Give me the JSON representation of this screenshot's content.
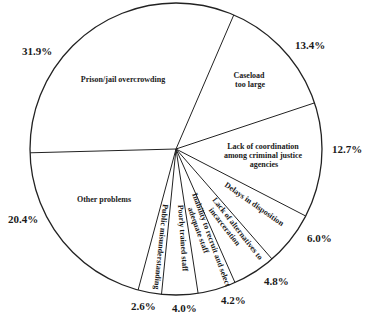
{
  "chart_data": {
    "type": "pie",
    "title": "",
    "start_angle_deg": 178.5,
    "direction": "clockwise",
    "slices": [
      {
        "label": "Prison/jail overcrowding",
        "value": 31.9,
        "pct_label": "31.9%"
      },
      {
        "label": "Caseload too large",
        "value": 13.4,
        "pct_label": "13.4%"
      },
      {
        "label": "Lack of coordination among criminal justice agencies",
        "value": 12.7,
        "pct_label": "12.7%"
      },
      {
        "label": "Delays in disposition",
        "value": 6.0,
        "pct_label": "6.0%"
      },
      {
        "label": "Lack of alternatives to incarceration",
        "value": 4.8,
        "pct_label": "4.8%"
      },
      {
        "label": "Inability to recruit and select adequate staff",
        "value": 4.2,
        "pct_label": "4.2%"
      },
      {
        "label": "Poorly trained staff",
        "value": 4.0,
        "pct_label": "4.0%"
      },
      {
        "label": "Public misunderstanding",
        "value": 2.6,
        "pct_label": "2.6%"
      },
      {
        "label": "Other problems",
        "value": 20.4,
        "pct_label": "20.4%"
      }
    ],
    "legend": "none (labels inside slices, percentages outside)"
  },
  "labels": {
    "prison": [
      "Prison/jail overcrowding"
    ],
    "caseload": [
      "Caseload",
      "too large"
    ],
    "coordination": [
      "Lack of coordination",
      "among criminal justice",
      "agencies"
    ],
    "delays": [
      "Delays in disposition"
    ],
    "alternatives": [
      "Lack of alternatives to",
      "incarceration"
    ],
    "inability": [
      "Inability to recruit and select",
      "adequate staff"
    ],
    "poorly": [
      "Poorly trained staff"
    ],
    "public": [
      "Public misunderstanding"
    ],
    "other": [
      "Other problems"
    ]
  },
  "percent_labels": {
    "prison": "31.9%",
    "caseload": "13.4%",
    "coordination": "12.7%",
    "delays": "6.0%",
    "alternatives": "4.8%",
    "inability": "4.2%",
    "poorly": "4.0%",
    "public": "2.6%",
    "other": "20.4%"
  }
}
